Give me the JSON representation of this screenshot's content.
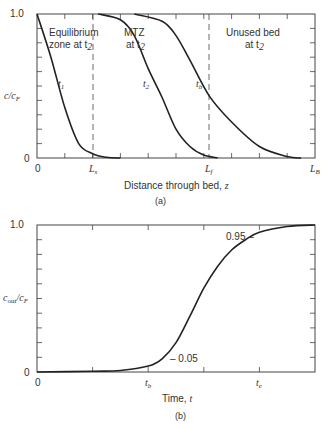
{
  "chart_data": [
    {
      "id": "a",
      "type": "line",
      "caption": "(a)",
      "xlabel": "Distance through bed, z",
      "ylabel": "c/c_F",
      "ylim": [
        0,
        1.0
      ],
      "yticks_labels": [
        "0",
        "1.0"
      ],
      "xtick_labels": [
        "0",
        "L_s",
        "L_f",
        "L_B"
      ],
      "x_marks": {
        "L_s": 0.2,
        "L_f": 0.62,
        "L_B": 1.0
      },
      "grid": false,
      "regions": [
        {
          "label_line1": "Equilibrium",
          "label_line2": "zone at t2"
        },
        {
          "label_line1": "MTZ",
          "label_line2": "at t2"
        },
        {
          "label_line1": "Unused bed",
          "label_line2": "at t2"
        }
      ],
      "series": [
        {
          "name": "t1",
          "x": [
            0,
            0.05,
            0.1,
            0.15,
            0.2,
            0.25,
            0.3
          ],
          "y": [
            1.0,
            0.7,
            0.35,
            0.1,
            0.03,
            0.005,
            0.0
          ]
        },
        {
          "name": "t2",
          "x": [
            0.22,
            0.3,
            0.35,
            0.4,
            0.45,
            0.5,
            0.55,
            0.6,
            0.65
          ],
          "y": [
            1.0,
            0.96,
            0.85,
            0.62,
            0.42,
            0.2,
            0.08,
            0.02,
            0.0
          ]
        },
        {
          "name": "tb",
          "x": [
            0.35,
            0.45,
            0.5,
            0.55,
            0.62,
            0.7,
            0.8,
            0.9,
            0.95
          ],
          "y": [
            1.0,
            0.95,
            0.85,
            0.68,
            0.43,
            0.25,
            0.08,
            0.01,
            0.0
          ]
        }
      ],
      "curve_labels": [
        "t1",
        "t2",
        "tb"
      ]
    },
    {
      "id": "b",
      "type": "line",
      "caption": "(b)",
      "xlabel": "Time, t",
      "ylabel": "c_out/c_F",
      "ylim": [
        0,
        1.0
      ],
      "yticks_labels": [
        "0",
        "1.0"
      ],
      "xtick_labels": [
        "0",
        "t_b",
        "t_e"
      ],
      "x_marks": {
        "t_b": 0.4,
        "t_e": 0.8
      },
      "grid": false,
      "annotations": [
        "- 0.05",
        "0.95 -"
      ],
      "series": [
        {
          "name": "breakthrough curve",
          "x": [
            0,
            0.2,
            0.3,
            0.4,
            0.45,
            0.5,
            0.55,
            0.6,
            0.65,
            0.7,
            0.75,
            0.8,
            0.9,
            1.0
          ],
          "y": [
            0.0,
            0.005,
            0.01,
            0.04,
            0.09,
            0.2,
            0.38,
            0.57,
            0.72,
            0.83,
            0.9,
            0.95,
            0.99,
            1.0
          ]
        }
      ]
    }
  ],
  "labels": {
    "a": {
      "y_top": "1.0",
      "y_bottom": "0",
      "x_zero": "0",
      "ylabel_main": "c/c",
      "ylabel_sub": "F",
      "region1_l1": "Equilibrium",
      "region1_l2": "zone at t",
      "region1_sub": "2",
      "region2_l1": "MTZ",
      "region2_l2": "at t",
      "region2_sub": "2",
      "region3_l1": "Unused bed",
      "region3_l2": "at t",
      "region3_sub": "2",
      "t1": "t",
      "t1_sub": "1",
      "t2": "t",
      "t2_sub": "2",
      "tb": "t",
      "tb_sub": "b",
      "Ls": "L",
      "Ls_sub": "s",
      "Lf": "L",
      "Lf_sub": "f",
      "LB": "L",
      "LB_sub": "B",
      "xlabel": "Distance through bed, ",
      "xlabel_var": "z",
      "caption": "(a)"
    },
    "b": {
      "y_top": "1.0",
      "y_bottom": "0",
      "x_zero": "0",
      "ylabel_c": "c",
      "ylabel_out": "out",
      "ylabel_rest": "/c",
      "ylabel_F": "F",
      "tb": "t",
      "tb_sub": "b",
      "te": "t",
      "te_sub": "e",
      "ann_low": "– 0.05",
      "ann_high": "0.95 –",
      "xlabel": "Time, ",
      "xlabel_var": "t",
      "caption": "(b)"
    }
  }
}
